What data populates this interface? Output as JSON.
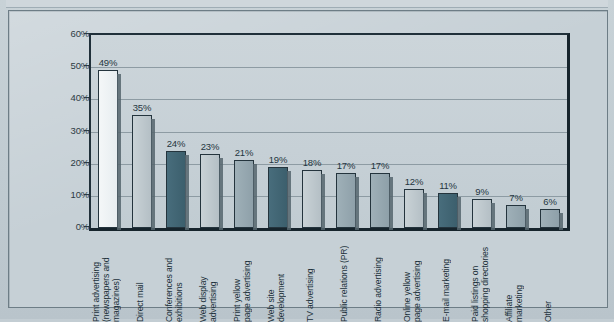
{
  "chart_data": {
    "type": "bar",
    "title": "",
    "xlabel": "",
    "ylabel": "",
    "ylim": [
      0,
      60
    ],
    "yticks": [
      "0%",
      "10%",
      "20%",
      "30%",
      "40%",
      "50%",
      "60%"
    ],
    "ytick_values": [
      0,
      10,
      20,
      30,
      40,
      50,
      60
    ],
    "grid": true,
    "legend": "none",
    "categories": [
      "Print advertising\n(newspapers and\nmagazines)",
      "Direct mail",
      "Conferences and\nexhibitions",
      "Web display\nadvertising",
      "Print yellow\npage advertising",
      "Web site\ndevelopment",
      "TV advertising",
      "Public relations (PR)",
      "Radio advertising",
      "Online yellow\npage advertising",
      "E-mail marketing",
      "Paid listings on\nshopping directories",
      "Affiliate\nmarketing",
      "Other"
    ],
    "values": [
      49,
      35,
      24,
      23,
      21,
      19,
      18,
      17,
      17,
      12,
      11,
      9,
      7,
      6
    ],
    "data_labels": [
      "49%",
      "35%",
      "24%",
      "23%",
      "21%",
      "19%",
      "18%",
      "17%",
      "17%",
      "12%",
      "11%",
      "9%",
      "7%",
      "6%"
    ],
    "bar_colors": [
      "white",
      "lgray",
      "teal",
      "lgray",
      "mgray",
      "teal",
      "lgray",
      "mgray",
      "mgray",
      "lgray",
      "teal",
      "lgray",
      "mgray",
      "mgray"
    ],
    "palette": {
      "white": "#f0f4f6",
      "lgray": "#c1cbd0",
      "mgray": "#97a8b0",
      "teal": "#426574",
      "background": "#c6d0d6",
      "axis": "#16242c",
      "grid": "#8d9ba3",
      "text": "#20303a"
    }
  }
}
